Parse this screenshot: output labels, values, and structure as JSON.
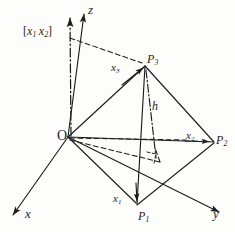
{
  "figure": {
    "ink_color": "#1d1d1d",
    "background_color": "#fdfdfb",
    "labels": {
      "axis_x": "x",
      "axis_y": "y",
      "axis_z": "z",
      "origin": "O",
      "point_1": "P",
      "point_1_sub": "1",
      "point_2": "P",
      "point_2_sub": "2",
      "point_3": "P",
      "point_3_sub": "3",
      "vector_1": "x",
      "vector_1_sub": "1",
      "vector_2": "x",
      "vector_2_sub": "2",
      "vector_3": "x",
      "vector_3_sub": "3",
      "altitude": "h",
      "cross_product_open": "[",
      "cross_product_a": "x",
      "cross_product_a_sub": "1",
      "cross_product_b": "x",
      "cross_product_b_sub": "2",
      "cross_product_close": "]"
    },
    "geometry": {
      "origin": [
        68,
        137
      ],
      "p1": [
        137,
        205
      ],
      "p2": [
        215,
        142
      ],
      "p3": [
        145,
        65
      ],
      "foot_of_altitude": [
        155,
        155
      ],
      "axis_x_end": [
        10,
        218
      ],
      "axis_y_end": [
        222,
        215
      ],
      "axis_z_end": [
        84,
        10
      ],
      "cross_vector_end": [
        70,
        14
      ],
      "base_projection": [
        [
          68,
          137
        ],
        [
          155,
          155
        ],
        [
          100,
          165
        ]
      ]
    },
    "line_styles": {
      "solid": "tetrahedron edges and axes",
      "dashed": "hidden base-plane projection lines",
      "dash_dot": "altitude h and cross-product vector"
    }
  }
}
